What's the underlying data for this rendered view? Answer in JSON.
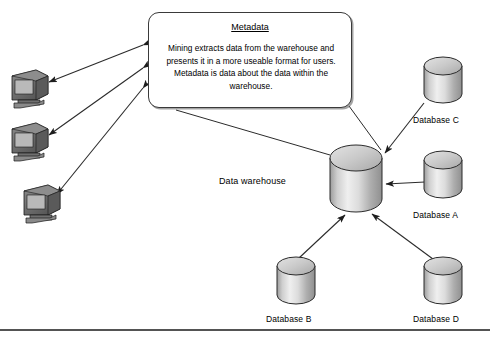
{
  "diagram": {
    "type": "flow-diagram",
    "background_color": "#ffffff",
    "line_color": "#2b2b2b",
    "cylinder_fill_light": "#f2f2f2",
    "cylinder_fill_dark": "#8a8a8a"
  },
  "metadata_box": {
    "title": "Metadata",
    "body": "Mining extracts data from the warehouse and presents it in a more useable format for users. Metadata is data about the data within the warehouse.",
    "shape": "rounded-callout"
  },
  "warehouse": {
    "label": "Data warehouse",
    "shape": "cylinder"
  },
  "databases": [
    {
      "id": "db-c",
      "label": "Database C",
      "shape": "cylinder"
    },
    {
      "id": "db-a",
      "label": "Database A",
      "shape": "cylinder"
    },
    {
      "id": "db-b",
      "label": "Database B",
      "shape": "cylinder"
    },
    {
      "id": "db-d",
      "label": "Database D",
      "shape": "cylinder"
    }
  ],
  "clients": [
    {
      "id": "client-1",
      "icon": "desktop-computer-icon"
    },
    {
      "id": "client-2",
      "icon": "desktop-computer-icon"
    },
    {
      "id": "client-3",
      "icon": "desktop-computer-icon"
    }
  ],
  "connections": [
    {
      "from": "metadata_box",
      "to": "client-1",
      "arrows": "both"
    },
    {
      "from": "metadata_box",
      "to": "client-2",
      "arrows": "both"
    },
    {
      "from": "metadata_box",
      "to": "client-3",
      "arrows": "both"
    },
    {
      "from": "metadata_box",
      "to": "warehouse",
      "arrows": "none"
    },
    {
      "from": "db-c",
      "to": "warehouse",
      "arrows": "to"
    },
    {
      "from": "db-a",
      "to": "warehouse",
      "arrows": "to"
    },
    {
      "from": "db-b",
      "to": "warehouse",
      "arrows": "to"
    },
    {
      "from": "db-d",
      "to": "warehouse",
      "arrows": "to"
    }
  ],
  "footer_rule": {
    "visible": true
  }
}
